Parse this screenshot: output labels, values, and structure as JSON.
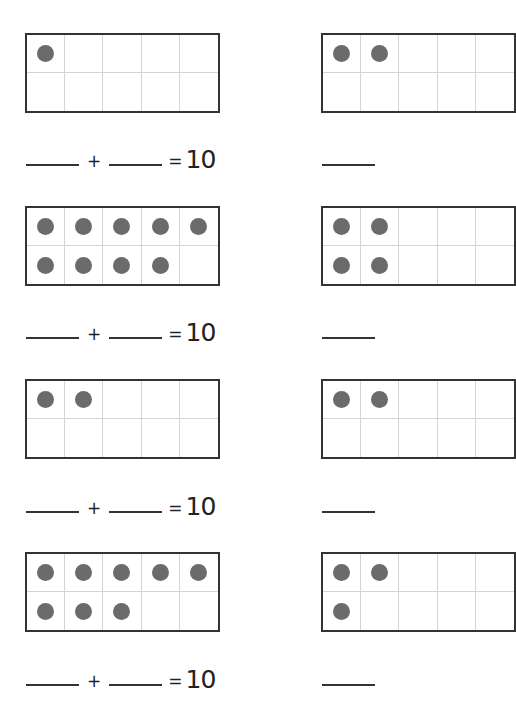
{
  "worksheet": {
    "columns": [
      {
        "problems": [
          {
            "filled": 1,
            "equation": {
              "plus": "+",
              "equals": "=",
              "total": "10"
            }
          },
          {
            "filled": 9,
            "equation": {
              "plus": "+",
              "equals": "=",
              "total": "10"
            }
          },
          {
            "filled": 2,
            "equation": {
              "plus": "+",
              "equals": "=",
              "total": "10"
            }
          },
          {
            "filled": 8,
            "equation": {
              "plus": "+",
              "equals": "=",
              "total": "10"
            }
          }
        ]
      },
      {
        "problems": [
          {
            "visible_dots_row1": 2,
            "visible_dots_row2": 0
          },
          {
            "visible_dots_row1": 2,
            "visible_dots_row2": 2
          },
          {
            "visible_dots_row1": 2,
            "visible_dots_row2": 0
          },
          {
            "visible_dots_row1": 2,
            "visible_dots_row2": 1
          }
        ]
      }
    ],
    "colors": {
      "dot": "#6b6b6b",
      "frame_border": "#333333",
      "grid_line": "#d4d4d4"
    }
  }
}
